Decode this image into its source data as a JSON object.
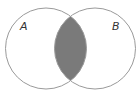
{
  "diagram": {
    "type": "venn",
    "sets": [
      {
        "label": "A",
        "cx": 46,
        "cy": 48.5,
        "r": 40.5
      },
      {
        "label": "B",
        "cx": 95,
        "cy": 48.5,
        "r": 40.5
      }
    ],
    "shaded_region": "A ∩ B",
    "colors": {
      "outline": "#9a9a9a",
      "shade": "#7a7a7a",
      "background": "#ffffff",
      "label": "#333333"
    }
  }
}
